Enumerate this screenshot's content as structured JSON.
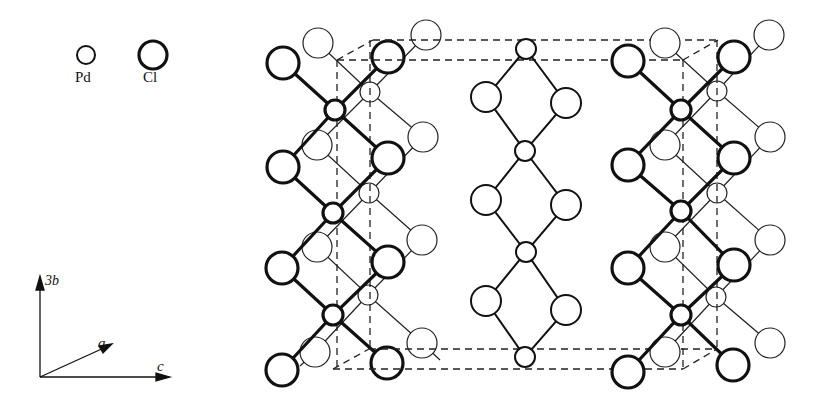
{
  "legend": {
    "items": [
      {
        "label": "Pd",
        "radius": 9
      },
      {
        "label": "Cl",
        "radius": 15
      }
    ]
  },
  "axes": {
    "vertical": "3b",
    "diagonal": "a",
    "horizontal": "c"
  },
  "colors": {
    "stroke": "#111111",
    "background": "#ffffff"
  },
  "structure": {
    "description": "PdCl2 chain structure viewed along a, unit cell dashed",
    "atoms": {
      "pd_radius": 9,
      "cl_radius": 16
    }
  }
}
